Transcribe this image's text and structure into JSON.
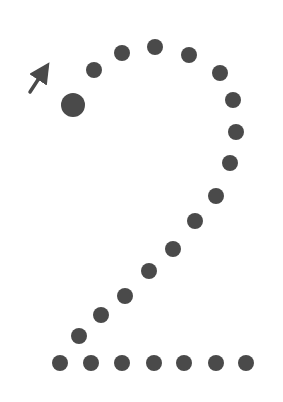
{
  "worksheet": {
    "subject": "digit tracing",
    "digit": "2",
    "dot_color": "#4a4a4a",
    "start_dot": {
      "x": 73,
      "y": 105,
      "r": 12
    },
    "direction_arrow": {
      "from": [
        30,
        92
      ],
      "to": [
        47,
        66
      ]
    },
    "dot_radius": 8,
    "dots": [
      {
        "x": 94,
        "y": 70
      },
      {
        "x": 122,
        "y": 53
      },
      {
        "x": 155,
        "y": 47
      },
      {
        "x": 189,
        "y": 55
      },
      {
        "x": 220,
        "y": 73
      },
      {
        "x": 233,
        "y": 100
      },
      {
        "x": 236,
        "y": 132
      },
      {
        "x": 230,
        "y": 163
      },
      {
        "x": 216,
        "y": 196
      },
      {
        "x": 195,
        "y": 221
      },
      {
        "x": 173,
        "y": 249
      },
      {
        "x": 149,
        "y": 271
      },
      {
        "x": 125,
        "y": 296
      },
      {
        "x": 101,
        "y": 315
      },
      {
        "x": 79,
        "y": 336
      },
      {
        "x": 60,
        "y": 363
      },
      {
        "x": 91,
        "y": 363
      },
      {
        "x": 122,
        "y": 363
      },
      {
        "x": 154,
        "y": 363
      },
      {
        "x": 184,
        "y": 363
      },
      {
        "x": 216,
        "y": 363
      },
      {
        "x": 246,
        "y": 363
      }
    ]
  }
}
